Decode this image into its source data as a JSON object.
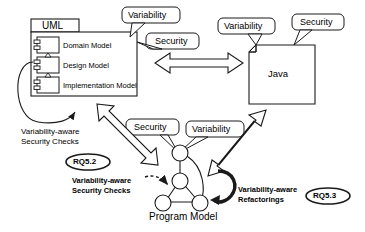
{
  "diagram": {
    "type": "architecture-overview-diagram",
    "uml_package": {
      "tab_label": "UML",
      "components": [
        {
          "label": "Domain Model"
        },
        {
          "label": "Design Model"
        },
        {
          "label": "Implementation Model"
        }
      ]
    },
    "java_note": {
      "label": "Java"
    },
    "program_model": {
      "label": "Program Model"
    },
    "callouts": [
      {
        "id": "uml-variability",
        "label": "Variability"
      },
      {
        "id": "uml-security",
        "label": "Security"
      },
      {
        "id": "java-variability",
        "label": "Variability"
      },
      {
        "id": "java-security",
        "label": "Security"
      },
      {
        "id": "pm-security",
        "label": "Security"
      },
      {
        "id": "pm-variability",
        "label": "Variability"
      }
    ],
    "annotations": [
      {
        "id": "uml-checks",
        "line1": "Variability-aware",
        "line2": "Security Checks"
      },
      {
        "id": "pm-checks",
        "line1": "Variability-aware",
        "line2": "Security Checks"
      },
      {
        "id": "pm-refactorings",
        "line1": "Variability-aware",
        "line2": "Refactorings"
      }
    ],
    "badges": [
      {
        "id": "rq52",
        "label": "RQ5.2"
      },
      {
        "id": "rq53",
        "label": "RQ5.3"
      }
    ],
    "colors": {
      "stroke": "#1a1a1a",
      "background": "#ffffff",
      "fill": "#ffffff"
    }
  }
}
